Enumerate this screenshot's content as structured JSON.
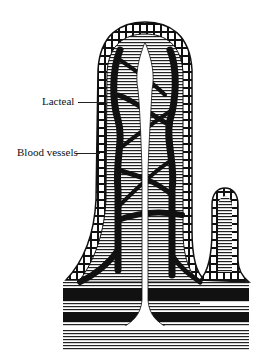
{
  "figure": {
    "labels": [
      {
        "id": "lacteal",
        "text": "Lacteal"
      },
      {
        "id": "blood-vessels",
        "text": "Blood vessels"
      }
    ],
    "colors": {
      "ink": "#111111",
      "paper": "#ffffff"
    }
  }
}
